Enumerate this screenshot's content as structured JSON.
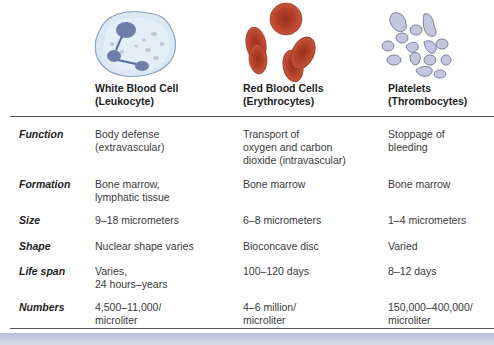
{
  "columns": [
    {
      "title": "White Blood Cell",
      "subtitle": "(Leukocyte)",
      "image": "white-blood-cell-illustration"
    },
    {
      "title": "Red Blood Cells",
      "subtitle": "(Erythrocytes)",
      "image": "red-blood-cells-illustration"
    },
    {
      "title": "Platelets",
      "subtitle": "(Thrombocytes)",
      "image": "platelets-illustration"
    }
  ],
  "rows": [
    {
      "label": "Function",
      "values": [
        "Body defense\n(extravascular)",
        "Transport of\noxygen and carbon\ndioxide (intravascular)",
        "Stoppage of\nbleeding"
      ]
    },
    {
      "label": "Formation",
      "values": [
        "Bone marrow,\nlymphatic tissue",
        "Bone marrow",
        "Bone marrow"
      ]
    },
    {
      "label": "Size",
      "values": [
        "9–18 micrometers",
        "6–8 micrometers",
        "1–4 micrometers"
      ]
    },
    {
      "label": "Shape",
      "values": [
        "Nuclear shape varies",
        "Bioconcave disc",
        "Varied"
      ]
    },
    {
      "label": "Life span",
      "values": [
        "Varies,\n24 hours–years",
        "100–120 days",
        "8–12 days"
      ]
    },
    {
      "label": "Numbers",
      "values": [
        "4,500–11,000/\nmicroliter",
        "4–6 million/\nmicroliter",
        "150,000–400,000/\nmicroliter"
      ]
    }
  ],
  "colors": {
    "wbc_fill": "#dbe8f3",
    "wbc_nucleus": "#5b6a9c",
    "rbc_fill": "#b5422a",
    "rbc_center": "#9a2f1c",
    "platelet_fill": "#c3c6dd",
    "platelet_edge": "#7d7f9c",
    "bottom_bar": "#c3c6e0"
  }
}
